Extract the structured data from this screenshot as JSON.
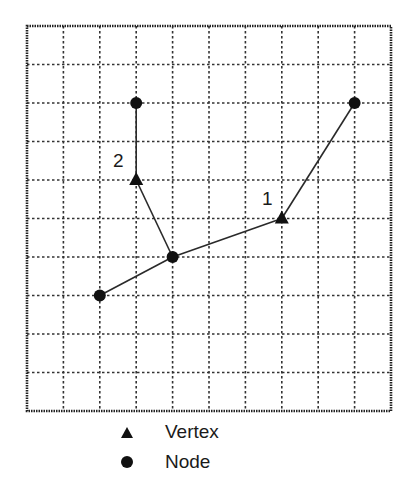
{
  "diagram": {
    "grid": {
      "columns": 10,
      "rows": 10,
      "left": 27,
      "top": 26,
      "right": 391,
      "bottom": 411,
      "line_style": "dotted",
      "line_color": "#333333"
    },
    "nodes": [
      {
        "id": "A",
        "col": 3,
        "row": 2
      },
      {
        "id": "B",
        "col": 4,
        "row": 6
      },
      {
        "id": "C",
        "col": 2,
        "row": 7
      },
      {
        "id": "D",
        "col": 9,
        "row": 2
      }
    ],
    "vertices": [
      {
        "id": "2",
        "label": "2",
        "col": 3,
        "row": 4,
        "label_x": 113,
        "label_y": 150
      },
      {
        "id": "1",
        "label": "1",
        "col": 7,
        "row": 5,
        "label_x": 262,
        "label_y": 188
      }
    ],
    "edges": [
      [
        "A",
        "2"
      ],
      [
        "2",
        "B"
      ],
      [
        "C",
        "B"
      ],
      [
        "B",
        "1"
      ],
      [
        "1",
        "D"
      ]
    ]
  },
  "legend": {
    "items": [
      {
        "symbol": "triangle",
        "icon": "triangle-icon",
        "label": "Vertex"
      },
      {
        "symbol": "circle",
        "icon": "circle-icon",
        "label": "Node"
      }
    ]
  }
}
